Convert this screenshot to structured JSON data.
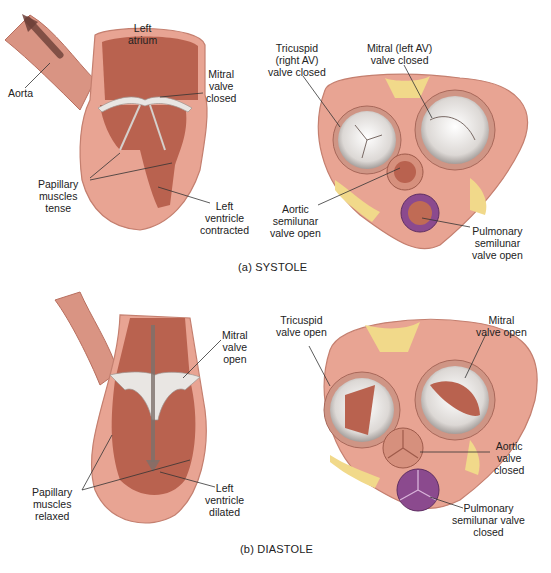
{
  "figure": {
    "colors": {
      "myocardium": "#e8a493",
      "myocardium_light": "#f2c4b6",
      "cavity": "#b9624f",
      "cavity_dark": "#a4513f",
      "valve_white": "#e9e6e3",
      "fat": "#f1d98a",
      "pulmonary": "#8b4a8e",
      "arrow": "#7a4a40",
      "leader": "#333333"
    },
    "systole": {
      "caption": "(a) SYSTOLE",
      "long_section": {
        "labels": {
          "left_atrium": "Left\natrium",
          "aorta": "Aorta",
          "mitral": "Mitral\nvalve\nclosed",
          "papillary": "Papillary\nmuscles\ntense",
          "ventricle": "Left\nventricle\ncontracted"
        }
      },
      "cross_section": {
        "labels": {
          "tricuspid": "Tricuspid\n(right AV)\nvalve closed",
          "mitral": "Mitral (left AV)\nvalve closed",
          "aortic": "Aortic\nsemilunar\nvalve open",
          "pulmonary": "Pulmonary\nsemilunar\nvalve open"
        }
      }
    },
    "diastole": {
      "caption": "(b) DIASTOLE",
      "long_section": {
        "labels": {
          "mitral": "Mitral\nvalve\nopen",
          "papillary": "Papillary\nmuscles\nrelaxed",
          "ventricle": "Left\nventricle\ndilated"
        }
      },
      "cross_section": {
        "labels": {
          "tricuspid": "Tricuspid\nvalve open",
          "mitral": "Mitral\nvalve open",
          "aortic": "Aortic\nvalve\nclosed",
          "pulmonary": "Pulmonary\nsemilunar valve\nclosed"
        }
      }
    }
  }
}
